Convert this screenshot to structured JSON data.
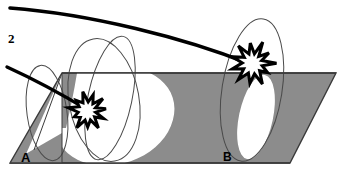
{
  "figure": {
    "index_label": "2",
    "caption": "",
    "width": 343,
    "height": 171,
    "background_color": "#ffffff"
  },
  "colors": {
    "plane_fill": "#8c8c8c",
    "plane_stroke": "#333333",
    "cone_fill": "#ffffff",
    "cone_stroke": "#4a4a4a",
    "trajectory_stroke": "#000000",
    "burst_fill": "#ffffff",
    "burst_stroke": "#000000",
    "label_color": "#000000"
  },
  "plane": {
    "name": "ground-plane",
    "points": "62,73 336,73 290,163 10,163",
    "stroke_width": 1.4
  },
  "points_of_interest": [
    {
      "id": "A",
      "label": "A",
      "x": 24,
      "y": 158
    },
    {
      "id": "B",
      "label": "B",
      "x": 226,
      "y": 158
    }
  ],
  "cones": [
    {
      "name": "cone-left-small",
      "kind": "outline-ellipse",
      "cx": 47,
      "cy": 113,
      "rx": 20,
      "ry": 48,
      "rotate": -8
    },
    {
      "name": "cone-center-outline-a",
      "kind": "outline-ellipse",
      "cx": 104,
      "cy": 100,
      "rx": 35,
      "ry": 62,
      "rotate": -10
    },
    {
      "name": "cone-center-outline-b",
      "kind": "outline-ellipse",
      "cx": 110,
      "cy": 98,
      "rx": 22,
      "ry": 63,
      "rotate": 12
    },
    {
      "name": "cone-right-outline",
      "kind": "outline-ellipse",
      "cx": 252,
      "cy": 90,
      "rx": 30,
      "ry": 72,
      "rotate": 9
    }
  ],
  "intersection_regions": [
    {
      "name": "intersection-ellipse-left",
      "description": "white region below plane at A"
    },
    {
      "name": "intersection-ellipse-right",
      "description": "white region below plane at B"
    }
  ],
  "trajectories": [
    {
      "name": "trajectory-upper",
      "path": "M 10,8 C 90,14 185,38 250,64",
      "stroke_width": 3.6,
      "target": "B"
    },
    {
      "name": "trajectory-lower",
      "path": "M 7,67 C 40,82 68,98 88,110",
      "stroke_width": 3.4,
      "target": "A"
    }
  ],
  "bursts": [
    {
      "name": "impact-burst-a",
      "cx": 88,
      "cy": 111,
      "r_outer": 18,
      "r_inner": 9,
      "points": 11
    },
    {
      "name": "impact-burst-b",
      "cx": 253,
      "cy": 63,
      "r_outer": 21,
      "r_inner": 10,
      "points": 11
    }
  ]
}
